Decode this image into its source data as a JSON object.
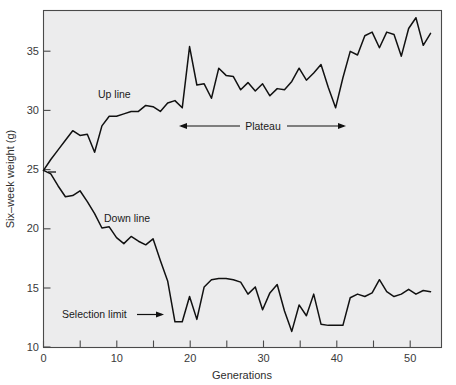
{
  "chart_data": {
    "type": "line",
    "title": "",
    "xlabel": "Generations",
    "ylabel": "Six–week weight (g)",
    "xlim": [
      0,
      54.5
    ],
    "ylim": [
      10,
      38
    ],
    "grid": false,
    "legend": "none (in-plot text labels)",
    "xticks": [
      0,
      10,
      20,
      30,
      40,
      50
    ],
    "yticks": [
      10,
      15,
      20,
      25,
      30,
      35
    ],
    "xtick_labels": [
      "0",
      "10",
      "20",
      "30",
      "40",
      "50"
    ],
    "ytick_labels": [
      "10",
      "15",
      "20",
      "25",
      "30",
      "35"
    ],
    "series": [
      {
        "name": "Up line",
        "x": [
          0,
          1,
          2,
          3,
          4,
          5,
          6,
          7,
          8,
          9,
          10,
          11,
          12,
          13,
          14,
          15,
          16,
          17,
          18,
          19,
          20,
          21,
          22,
          23,
          24,
          25,
          26,
          27,
          28,
          29,
          30,
          31,
          32,
          33,
          34,
          35,
          36,
          37,
          38,
          39,
          40,
          41,
          42,
          43,
          44,
          45,
          46,
          47,
          48,
          49,
          50,
          51,
          52,
          53
        ],
        "values": [
          24.7,
          25.6,
          26.4,
          27.2,
          28.0,
          27.6,
          27.7,
          26.2,
          28.4,
          29.2,
          29.2,
          29.4,
          29.6,
          29.6,
          30.1,
          30.0,
          29.6,
          30.3,
          30.5,
          29.9,
          35.0,
          31.8,
          31.9,
          30.7,
          33.2,
          32.6,
          32.5,
          31.4,
          32.0,
          31.3,
          31.9,
          30.9,
          31.5,
          31.4,
          32.1,
          33.2,
          32.2,
          32.8,
          33.5,
          31.6,
          29.9,
          32.4,
          34.6,
          34.3,
          35.9,
          36.2,
          34.9,
          36.2,
          36.0,
          34.2,
          36.5,
          37.4,
          35.1,
          36.1
        ]
      },
      {
        "name": "Down line",
        "x": [
          0,
          1,
          2,
          3,
          4,
          5,
          6,
          7,
          8,
          9,
          10,
          11,
          12,
          13,
          14,
          15,
          16,
          17,
          18,
          19,
          20,
          21,
          22,
          23,
          24,
          25,
          26,
          27,
          28,
          29,
          30,
          31,
          32,
          33,
          34,
          35,
          36,
          37,
          38,
          39,
          40,
          41,
          42,
          43,
          44,
          45,
          46,
          47,
          48,
          49,
          50,
          51,
          52,
          53
        ],
        "values": [
          24.7,
          24.4,
          23.4,
          22.5,
          22.6,
          23.0,
          22.1,
          21.1,
          19.9,
          20.0,
          19.1,
          18.6,
          19.2,
          18.8,
          18.5,
          19.0,
          17.2,
          15.5,
          12.1,
          12.1,
          14.2,
          12.3,
          15.0,
          15.6,
          15.7,
          15.7,
          15.6,
          15.4,
          14.4,
          15.0,
          13.1,
          14.5,
          15.2,
          13.0,
          11.3,
          13.5,
          12.6,
          14.4,
          11.9,
          11.8,
          11.8,
          11.8,
          14.1,
          14.4,
          14.2,
          14.5,
          15.6,
          14.6,
          14.2,
          14.4,
          14.8,
          14.4,
          14.7,
          14.6
        ]
      }
    ],
    "annotations": [
      {
        "id": "up-line-label",
        "text": "Up line",
        "x": 12.5,
        "y": 32.0
      },
      {
        "id": "down-line-label",
        "text": "Down line",
        "x": 13.5,
        "y": 20.8
      },
      {
        "id": "plateau-label",
        "text": "Plateau",
        "x": 30.0,
        "y": 28.2,
        "arrow": "double",
        "x_start": 24.0,
        "x_end": 41.0
      },
      {
        "id": "selection-limit-label",
        "text": "Selection limit",
        "x": 10.5,
        "y": 13.1,
        "arrow": "right",
        "x_end": 17.2
      }
    ],
    "colors": {
      "plot_background": "#ececed",
      "page_background": "#ffffff",
      "line": "#111111",
      "axis": "#4a4a4a",
      "tick_text": "#3a3a3a"
    }
  }
}
